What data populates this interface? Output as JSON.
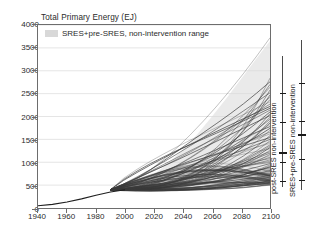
{
  "chart_data": {
    "type": "line",
    "title": "Total Primary Energy (EJ)",
    "xlabel": "",
    "ylabel": "Total Primary Energy (EJ)",
    "xlim": [
      1940,
      2100
    ],
    "ylim": [
      0,
      4000
    ],
    "xticks": [
      1940,
      1960,
      1980,
      2000,
      2020,
      2040,
      2060,
      2080,
      2100
    ],
    "yticks": [
      0,
      500,
      1000,
      1500,
      2000,
      2500,
      3000,
      3500,
      4000
    ],
    "grid": "horizontal",
    "legend": {
      "position": "top-left-inside",
      "entries": [
        {
          "label": "SRES+pre-SRES, non-intervention range",
          "swatch_color": "#d8d8d8",
          "type": "band"
        }
      ]
    },
    "shaded_band": {
      "name": "SRES+pre-SRES, non-intervention range",
      "color": "#d8d8d8",
      "x": [
        1990,
        2000,
        2010,
        2020,
        2030,
        2040,
        2050,
        2060,
        2070,
        2080,
        2090,
        2100
      ],
      "upper": [
        400,
        440,
        560,
        740,
        980,
        1280,
        1620,
        2000,
        2400,
        2820,
        3240,
        3650
      ],
      "lower": [
        360,
        390,
        420,
        450,
        470,
        480,
        490,
        500,
        505,
        510,
        515,
        520
      ]
    },
    "historical": {
      "name": "Historical total primary energy",
      "x": [
        1940,
        1950,
        1960,
        1970,
        1980,
        1990,
        2000
      ],
      "y": [
        50,
        80,
        130,
        200,
        280,
        350,
        400
      ]
    },
    "series_note": "Spaghetti of ~120 non-intervention scenario projections, 1990-2100",
    "scenario_endpoints_2100": [
      3720,
      2840,
      2760,
      2700,
      2640,
      2580,
      2520,
      2470,
      2420,
      2370,
      2320,
      2270,
      2220,
      2180,
      2140,
      2100,
      2060,
      2020,
      1980,
      1940,
      1900,
      1860,
      1820,
      1780,
      1740,
      1700,
      1660,
      1620,
      1580,
      1540,
      1500,
      1470,
      1440,
      1410,
      1380,
      1350,
      1320,
      1290,
      1260,
      1230,
      1200,
      1170,
      1140,
      1110,
      1080,
      1050,
      1020,
      995,
      970,
      945,
      920,
      900,
      880,
      860,
      840,
      820,
      800,
      780,
      760,
      745,
      730,
      715,
      700,
      685,
      670,
      655,
      640,
      625,
      610,
      600,
      590,
      580,
      570,
      560,
      550,
      540,
      530,
      520,
      510,
      500
    ],
    "annotation_bars": [
      {
        "label": "post-SRES non-intervention",
        "range": [
          480,
          3300
        ],
        "ticks": [
          600,
          1020,
          1240,
          1880,
          2500
        ],
        "thick_ticks": [
          1240
        ]
      },
      {
        "label": "SRES+pre-SRES non-intervention",
        "range": [
          420,
          3650
        ],
        "ticks": [
          620,
          1080,
          1620,
          1900,
          2720
        ],
        "thick_ticks": [
          1620
        ]
      }
    ]
  },
  "colors": {
    "axis": "#6d6d6d",
    "grid": "#dedede",
    "band": "#d8d8d8",
    "lines": "#3a3a3a",
    "text": "#2b2b2b",
    "background": "#ffffff"
  }
}
